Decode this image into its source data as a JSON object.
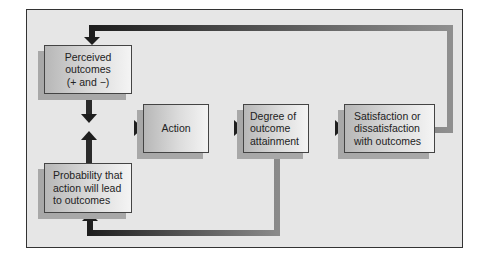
{
  "diagram": {
    "nodes": [
      {
        "id": "perceived",
        "label": "Perceived\noutcomes\n(+ and −)"
      },
      {
        "id": "probability",
        "label": "Probability that\naction will lead\nto outcomes"
      },
      {
        "id": "action",
        "label": "Action"
      },
      {
        "id": "degree",
        "label": "Degree of\noutcome\nattainment"
      },
      {
        "id": "satisfaction",
        "label": "Satisfaction or\ndissatisfaction\nwith outcomes"
      }
    ],
    "edges": [
      {
        "from": "perceived",
        "to": "action"
      },
      {
        "from": "probability",
        "to": "action"
      },
      {
        "from": "action",
        "to": "degree"
      },
      {
        "from": "degree",
        "to": "satisfaction"
      },
      {
        "from": "satisfaction",
        "to": "perceived"
      },
      {
        "from": "degree",
        "to": "probability"
      }
    ],
    "colors": {
      "arrow_dark": "#1e1e1e",
      "arrow_light": "#8a8a8a",
      "background": "#e6e6e6",
      "frame": "#333333"
    }
  }
}
